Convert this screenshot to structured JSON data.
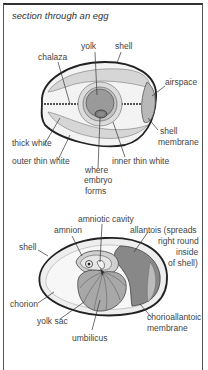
{
  "title": "section through an egg",
  "egg1": {
    "labels": {
      "yolk": "yolk",
      "shell": "shell",
      "chalaza": "chalaza",
      "airspace": "airspace",
      "shell_membrane_1": "shell",
      "shell_membrane_2": "membrane",
      "thick_white": "thick white",
      "outer_thin_white": "outer thin white",
      "inner_thin_white": "inner thin white",
      "where_embryo_1": "where",
      "where_embryo_2": "embryo",
      "where_embryo_3": "forms"
    }
  },
  "egg2": {
    "labels": {
      "amniotic_cavity": "amniotic cavity",
      "amnion": "amnion",
      "allantois_1": "allantois (spreads",
      "allantois_2": "right round",
      "allantois_3": "inside",
      "allantois_4": "of shell)",
      "shell": "shell",
      "chorion": "chorion",
      "yolk_sac": "yolk sac",
      "umbilicus": "umbilicus",
      "chorioallantoic_1": "chorioallantoic",
      "chorioallantoic_2": "membrane"
    }
  },
  "colors": {
    "shell_line": "#222222",
    "white_light": "#e8e8e8",
    "white_mid": "#d6d6d6",
    "yolk_outer": "#c4c4c4",
    "yolk": "#9a9a9a",
    "embryo_spot": "#7a7a7a",
    "allantois": "#888888",
    "yolk_sac": "#a8a8a8"
  }
}
